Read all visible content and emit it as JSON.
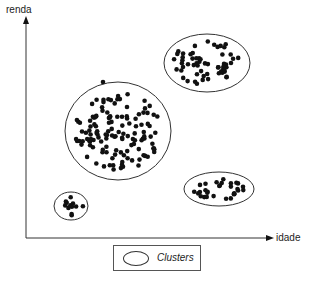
{
  "diagram": {
    "y_axis_label": "renda",
    "x_axis_label": "idade",
    "legend": {
      "label": "Clusters",
      "icon": "ellipse-icon"
    },
    "clusters": [
      {
        "name": "large-center",
        "cx": 118,
        "cy": 131,
        "rx": 53,
        "ry": 49,
        "dots": 130
      },
      {
        "name": "top-right",
        "cx": 207,
        "cy": 63,
        "rx": 43,
        "ry": 29,
        "dots": 60
      },
      {
        "name": "bottom-right",
        "cx": 219,
        "cy": 189,
        "rx": 35,
        "ry": 17,
        "dots": 30
      },
      {
        "name": "small-bottom-left",
        "cx": 71,
        "cy": 206,
        "rx": 17,
        "ry": 14,
        "dots": 12
      }
    ],
    "colors": {
      "dot": "#111111",
      "line": "#333333"
    }
  }
}
